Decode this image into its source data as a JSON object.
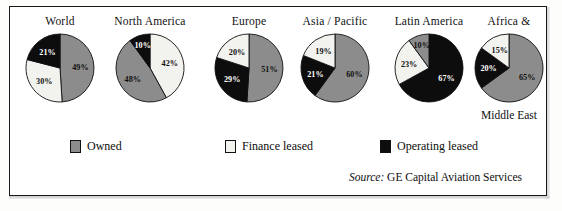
{
  "chart_data": {
    "type": "pie",
    "title": "",
    "subtitle": "",
    "legend_position": "bottom",
    "grid": false,
    "series": [
      {
        "name": "Owned",
        "color": "#8c8c8c"
      },
      {
        "name": "Finance leased",
        "color": "#f2f2ee"
      },
      {
        "name": "Operating leased",
        "color": "#0d0d0d"
      }
    ],
    "categories": [
      "World",
      "North America",
      "Europe",
      "Asia / Pacific",
      "Latin America",
      "Africa & Middle East"
    ],
    "pies": [
      {
        "name": "World",
        "title": "World",
        "subtitle": "",
        "slices": [
          {
            "label": "Owned",
            "value": 49,
            "value_text": "49%",
            "color": "#8c8c8c",
            "text_color": "#111111"
          },
          {
            "label": "Finance leased",
            "value": 30,
            "value_text": "30%",
            "color": "#f2f2ee",
            "text_color": "#111111"
          },
          {
            "label": "Operating leased",
            "value": 21,
            "value_text": "21%",
            "color": "#0d0d0d",
            "text_color": "#ffffff"
          }
        ]
      },
      {
        "name": "North America",
        "title": "North America",
        "subtitle": "",
        "slices": [
          {
            "label": "Finance leased",
            "value": 42,
            "value_text": "42%",
            "color": "#f2f2ee",
            "text_color": "#111111"
          },
          {
            "label": "Owned",
            "value": 48,
            "value_text": "48%",
            "color": "#8c8c8c",
            "text_color": "#111111"
          },
          {
            "label": "Operating leased",
            "value": 10,
            "value_text": "10%",
            "color": "#0d0d0d",
            "text_color": "#ffffff"
          }
        ]
      },
      {
        "name": "Europe",
        "title": "Europe",
        "subtitle": "",
        "slices": [
          {
            "label": "Owned",
            "value": 51,
            "value_text": "51%",
            "color": "#8c8c8c",
            "text_color": "#111111"
          },
          {
            "label": "Operating leased",
            "value": 29,
            "value_text": "29%",
            "color": "#0d0d0d",
            "text_color": "#ffffff"
          },
          {
            "label": "Finance leased",
            "value": 20,
            "value_text": "20%",
            "color": "#f2f2ee",
            "text_color": "#111111"
          }
        ]
      },
      {
        "name": "Asia / Pacific",
        "title": "Asia / Pacific",
        "subtitle": "",
        "slices": [
          {
            "label": "Owned",
            "value": 60,
            "value_text": "60%",
            "color": "#8c8c8c",
            "text_color": "#111111"
          },
          {
            "label": "Operating leased",
            "value": 21,
            "value_text": "21%",
            "color": "#0d0d0d",
            "text_color": "#ffffff"
          },
          {
            "label": "Finance leased",
            "value": 19,
            "value_text": "19%",
            "color": "#f2f2ee",
            "text_color": "#111111"
          }
        ]
      },
      {
        "name": "Latin America",
        "title": "Latin America",
        "subtitle": "",
        "slices": [
          {
            "label": "Operating leased",
            "value": 67,
            "value_text": "67%",
            "color": "#0d0d0d",
            "text_color": "#ffffff"
          },
          {
            "label": "Finance leased",
            "value": 23,
            "value_text": "23%",
            "color": "#f2f2ee",
            "text_color": "#111111"
          },
          {
            "label": "Owned",
            "value": 10,
            "value_text": "10%",
            "color": "#8c8c8c",
            "text_color": "#111111"
          }
        ]
      },
      {
        "name": "Africa & Middle East",
        "title": "Africa &",
        "subtitle": "Middle East",
        "slices": [
          {
            "label": "Owned",
            "value": 65,
            "value_text": "65%",
            "color": "#8c8c8c",
            "text_color": "#111111"
          },
          {
            "label": "Operating leased",
            "value": 20,
            "value_text": "20%",
            "color": "#0d0d0d",
            "text_color": "#ffffff"
          },
          {
            "label": "Finance leased",
            "value": 15,
            "value_text": "15%",
            "color": "#f2f2ee",
            "text_color": "#111111"
          }
        ]
      }
    ]
  },
  "legend": {
    "items": [
      {
        "label": "Owned",
        "color": "#8c8c8c"
      },
      {
        "label": "Finance leased",
        "color": "#f2f2ee"
      },
      {
        "label": "Operating leased",
        "color": "#0d0d0d"
      }
    ]
  },
  "source": {
    "prefix": "Source:",
    "text": "GE Capital Aviation Services"
  }
}
